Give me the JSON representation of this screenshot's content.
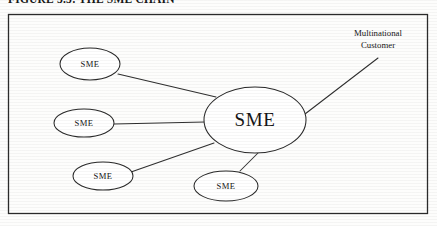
{
  "figure": {
    "caption": "FIGURE 3.3: THE SME CHAIN",
    "frame": {
      "x": 8,
      "y": 14,
      "width": 420,
      "height": 200
    }
  },
  "colors": {
    "stroke": "#2a2a2a",
    "text": "#151515",
    "background": "#fdfdfc",
    "node_fill": "#ffffff"
  },
  "nodes": [
    {
      "id": "sme-top-left",
      "label": "SME",
      "cx": 90,
      "cy": 64,
      "rx": 30,
      "ry": 16,
      "size": "small"
    },
    {
      "id": "sme-middle-left",
      "label": "SME",
      "cx": 84,
      "cy": 123,
      "rx": 30,
      "ry": 14,
      "size": "small"
    },
    {
      "id": "sme-bottom-left",
      "label": "SME",
      "cx": 103,
      "cy": 176,
      "rx": 30,
      "ry": 14,
      "size": "small"
    },
    {
      "id": "sme-bottom-center",
      "label": "SME",
      "cx": 226,
      "cy": 186,
      "rx": 32,
      "ry": 15,
      "size": "small"
    },
    {
      "id": "sme-central",
      "label": "SME",
      "cx": 255,
      "cy": 120,
      "rx": 51,
      "ry": 33,
      "size": "large"
    }
  ],
  "connectors": [
    {
      "id": "link-top-left-to-center",
      "from": "sme-top-left",
      "to": "sme-central",
      "x1": 118,
      "y1": 74,
      "x2": 216,
      "y2": 97
    },
    {
      "id": "link-middle-left-to-center",
      "from": "sme-middle-left",
      "to": "sme-central",
      "x1": 114,
      "y1": 124,
      "x2": 205,
      "y2": 122
    },
    {
      "id": "link-bottom-left-to-center",
      "from": "sme-bottom-left",
      "to": "sme-central",
      "x1": 131,
      "y1": 172,
      "x2": 214,
      "y2": 143
    },
    {
      "id": "link-bottom-center-to-center",
      "from": "sme-bottom-center",
      "to": "sme-central",
      "x1": 240,
      "y1": 171,
      "x2": 258,
      "y2": 153
    },
    {
      "id": "link-center-to-multinational",
      "from": "sme-central",
      "to": "multinational-customer-label",
      "x1": 305,
      "y1": 114,
      "x2": 378,
      "y2": 58
    }
  ],
  "callout": {
    "id": "multinational-customer-label",
    "line1": "Multinational",
    "line2": "Customer",
    "x": 378,
    "y1": 36,
    "y2": 48
  }
}
